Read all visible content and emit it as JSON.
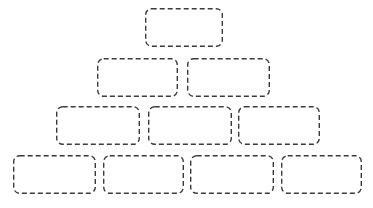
{
  "diagram": {
    "title": "",
    "type": "brick-pyramid",
    "background_color": "#ffffff",
    "stroke_color": "#3a3a3a",
    "stroke_width": 1.4,
    "dash_pattern": "5 3",
    "corner_radius": 6,
    "canvas": {
      "width": 373,
      "height": 208
    },
    "rows": [
      {
        "row_index": 1,
        "count": 1,
        "y": 8,
        "height": 39,
        "bricks": [
          {
            "label": "",
            "x": 145,
            "y": 8,
            "width": 78,
            "height": 39
          }
        ]
      },
      {
        "row_index": 2,
        "count": 2,
        "y": 58,
        "height": 39,
        "bricks": [
          {
            "label": "",
            "x": 97,
            "y": 58,
            "width": 81,
            "height": 39
          },
          {
            "label": "",
            "x": 187,
            "y": 58,
            "width": 83,
            "height": 39
          }
        ]
      },
      {
        "row_index": 3,
        "count": 3,
        "y": 106,
        "height": 39,
        "bricks": [
          {
            "label": "",
            "x": 56,
            "y": 106,
            "width": 84,
            "height": 39
          },
          {
            "label": "",
            "x": 148,
            "y": 106,
            "width": 84,
            "height": 39
          },
          {
            "label": "",
            "x": 238,
            "y": 106,
            "width": 82,
            "height": 39
          }
        ]
      },
      {
        "row_index": 4,
        "count": 4,
        "y": 155,
        "height": 39,
        "bricks": [
          {
            "label": "",
            "x": 13,
            "y": 155,
            "width": 83,
            "height": 39
          },
          {
            "label": "",
            "x": 103,
            "y": 155,
            "width": 81,
            "height": 39
          },
          {
            "label": "",
            "x": 190,
            "y": 155,
            "width": 84,
            "height": 39
          },
          {
            "label": "",
            "x": 281,
            "y": 155,
            "width": 81,
            "height": 39
          }
        ]
      }
    ]
  }
}
